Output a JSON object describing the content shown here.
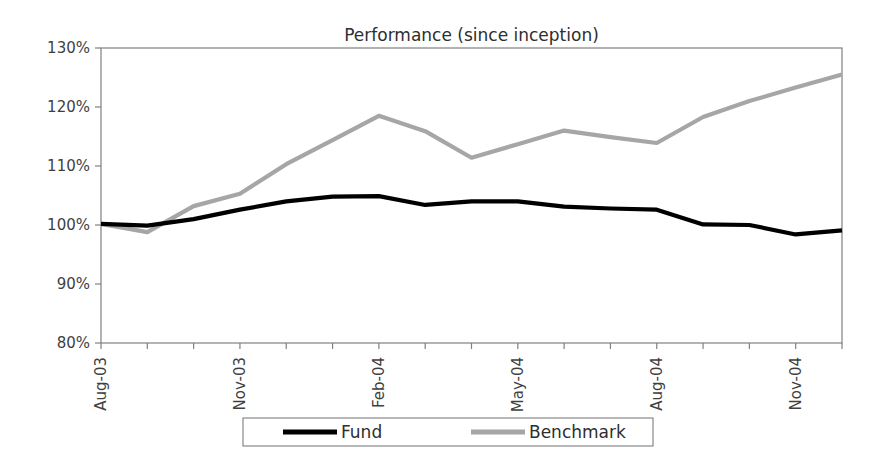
{
  "chart_data": {
    "type": "line",
    "title": "Performance (since inception)",
    "xlabel": "",
    "ylabel": "",
    "ylim": [
      80,
      130
    ],
    "ytick_values": [
      130,
      120,
      110,
      100,
      90,
      80
    ],
    "ytick_labels": [
      "130%",
      "120%",
      "110%",
      "100%",
      "90%",
      "80%"
    ],
    "grid": false,
    "legend_position": "bottom",
    "x": [
      "Aug-03",
      "Sep-03",
      "Oct-03",
      "Nov-03",
      "Dec-03",
      "Jan-04",
      "Feb-04",
      "Mar-04",
      "Apr-04",
      "May-04",
      "Jun-04",
      "Jul-04",
      "Aug-04",
      "Sep-04",
      "Oct-04",
      "Nov-04",
      "Dec-04"
    ],
    "xtick_labels": [
      "Aug-03",
      "Nov-03",
      "Feb-04",
      "May-04",
      "Aug-04",
      "Nov-04"
    ],
    "xtick_indices": [
      0,
      3,
      6,
      9,
      12,
      15
    ],
    "series": [
      {
        "name": "Fund",
        "color": "#000000",
        "values": [
          100.2,
          99.9,
          101.0,
          102.6,
          104.0,
          104.8,
          104.9,
          103.4,
          104.0,
          104.0,
          103.1,
          102.8,
          102.6,
          100.1,
          100.0,
          98.4,
          99.1
        ]
      },
      {
        "name": "Benchmark",
        "color": "#a6a6a6",
        "values": [
          100.2,
          98.8,
          103.2,
          105.3,
          110.3,
          114.4,
          118.5,
          115.9,
          111.4,
          113.7,
          116.0,
          114.9,
          113.9,
          118.3,
          121.0,
          123.3,
          125.5
        ]
      }
    ]
  },
  "axis": {
    "line_color": "#808080",
    "plot_left": 101,
    "plot_right": 842,
    "plot_top": 48,
    "plot_bottom": 343
  },
  "legend": {
    "border_color": "#7f7f7f",
    "entries": [
      {
        "label": "Fund",
        "color": "#000000"
      },
      {
        "label": "Benchmark",
        "color": "#a6a6a6"
      }
    ]
  }
}
